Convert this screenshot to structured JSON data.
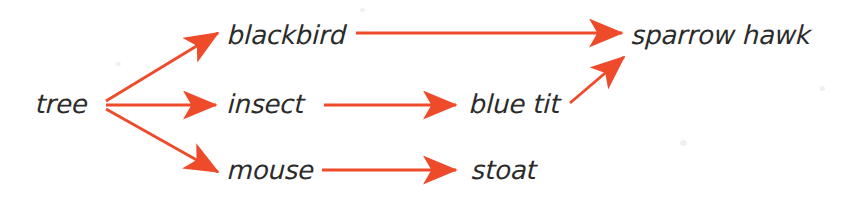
{
  "diagram": {
    "type": "food-web",
    "background_color": "#ffffff",
    "arrow_color": "#ee4b2b",
    "label_color": "#2b2b2b",
    "nodes": [
      {
        "id": "tree",
        "label": "tree",
        "x": 36,
        "y": 105,
        "trophic": "producer"
      },
      {
        "id": "blackbird",
        "label": "blackbird",
        "x": 228,
        "y": 36,
        "trophic": "consumer"
      },
      {
        "id": "insect",
        "label": "insect",
        "x": 228,
        "y": 105,
        "trophic": "consumer"
      },
      {
        "id": "mouse",
        "label": "mouse",
        "x": 228,
        "y": 171,
        "trophic": "consumer"
      },
      {
        "id": "blue_tit",
        "label": "blue tit",
        "x": 470,
        "y": 105,
        "trophic": "consumer"
      },
      {
        "id": "stoat",
        "label": "stoat",
        "x": 472,
        "y": 171,
        "trophic": "predator"
      },
      {
        "id": "sparrow_hawk",
        "label": "sparrow hawk",
        "x": 632,
        "y": 36,
        "trophic": "top-predator"
      }
    ],
    "edges": [
      {
        "id": "tree-blackbird",
        "from": "tree",
        "to": "blackbird",
        "x1": 106,
        "y1": 101,
        "x2": 218,
        "y2": 33
      },
      {
        "id": "tree-insect",
        "from": "tree",
        "to": "insect",
        "x1": 106,
        "y1": 105,
        "x2": 216,
        "y2": 105
      },
      {
        "id": "tree-mouse",
        "from": "tree",
        "to": "mouse",
        "x1": 106,
        "y1": 109,
        "x2": 218,
        "y2": 172
      },
      {
        "id": "blackbird-sparrowhawk",
        "from": "blackbird",
        "to": "sparrow_hawk",
        "x1": 356,
        "y1": 33,
        "x2": 622,
        "y2": 33
      },
      {
        "id": "insect-bluetit",
        "from": "insect",
        "to": "blue_tit",
        "x1": 324,
        "y1": 105,
        "x2": 456,
        "y2": 105
      },
      {
        "id": "mouse-stoat",
        "from": "mouse",
        "to": "stoat",
        "x1": 322,
        "y1": 170,
        "x2": 456,
        "y2": 170
      },
      {
        "id": "bluetit-sparrowhawk",
        "from": "blue_tit",
        "to": "sparrow_hawk",
        "x1": 570,
        "y1": 103,
        "x2": 624,
        "y2": 57
      }
    ]
  }
}
